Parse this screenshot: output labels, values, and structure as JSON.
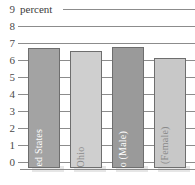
{
  "chart_data": {
    "type": "bar",
    "title": "percent",
    "xlabel": "",
    "ylabel": "percent",
    "ylim": [
      0,
      9
    ],
    "grid": true,
    "legend": "none",
    "categories": [
      "United States",
      "Ohio",
      "Ohio (Male)",
      "Ohio (Female)"
    ],
    "values": [
      6.8,
      6.6,
      6.85,
      6.25
    ],
    "tick_labels": [
      "9",
      "8",
      "7",
      "6",
      "5",
      "4",
      "3",
      "2",
      "1",
      "0"
    ],
    "series": [
      {
        "name": "percent",
        "values": [
          6.8,
          6.6,
          6.85,
          6.25
        ]
      }
    ],
    "bars": [
      {
        "label": "United States",
        "value": 6.8,
        "color": "#a3a3a3",
        "label_color": "#ffffff"
      },
      {
        "label": "Ohio",
        "value": 6.6,
        "color": "#cfcfcf",
        "label_color": "#8a8a8a"
      },
      {
        "label": "Ohio (Male)",
        "value": 6.85,
        "color": "#9a9a9a",
        "label_color": "#ffffff"
      },
      {
        "label": "Ohio (Female)",
        "value": 6.25,
        "color": "#c8c8c8",
        "label_color": "#8a8a8a"
      }
    ],
    "colors": {
      "grid": "#8c8c8c",
      "bar_dark": "#a3a3a3",
      "bar_light": "#cfcfcf",
      "bar_border": "#6e6e6e",
      "text": "#3c3c3c",
      "background": "#ffffff"
    }
  }
}
